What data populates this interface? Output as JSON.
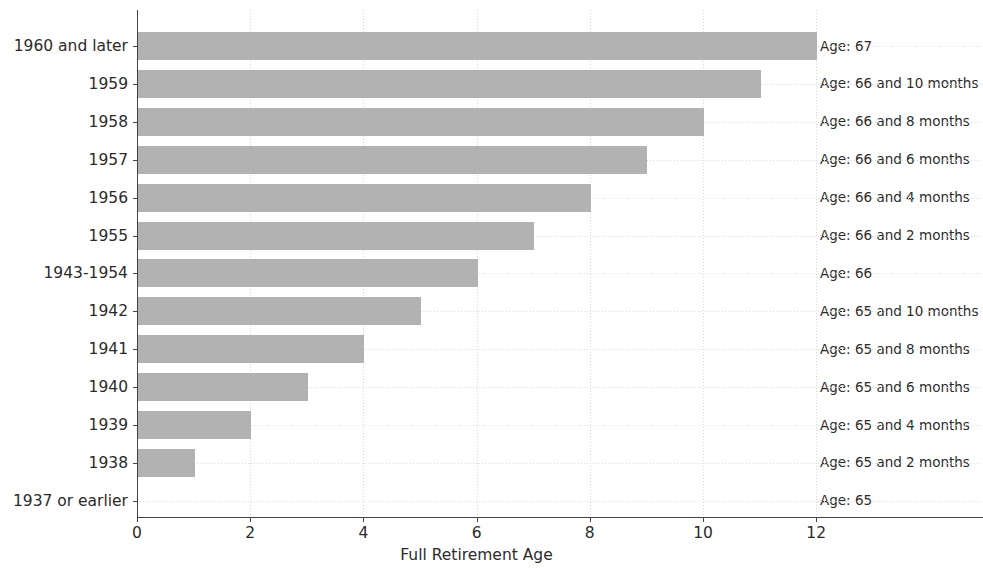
{
  "chart_data": {
    "type": "bar",
    "orientation": "horizontal",
    "title": "",
    "xlabel": "Full Retirement Age",
    "ylabel": "",
    "xlim": [
      0,
      12.7
    ],
    "xticks": [
      0,
      2,
      4,
      6,
      8,
      10,
      12
    ],
    "xtick_labels": [
      "0",
      "2",
      "4",
      "6",
      "8",
      "10",
      "12"
    ],
    "grid": true,
    "legend": null,
    "bar_color": "#b2b2b2",
    "categories": [
      "1960 and later",
      "1959",
      "1958",
      "1957",
      "1956",
      "1955",
      "1943-1954",
      "1942",
      "1941",
      "1940",
      "1939",
      "1938",
      "1937 or earlier"
    ],
    "values": [
      12,
      11,
      10,
      9,
      8,
      7,
      6,
      5,
      4,
      3,
      2,
      1,
      0
    ],
    "annotations": [
      "Age: 67",
      "Age: 66 and 10 months",
      "Age: 66 and 8 months",
      "Age: 66 and 6 months",
      "Age: 66 and 4 months",
      "Age: 66 and 2 months",
      "Age: 66",
      "Age: 65 and 10 months",
      "Age: 65 and 8 months",
      "Age: 65 and 6 months",
      "Age: 65 and 4 months",
      "Age: 65 and 2 months",
      "Age: 65"
    ]
  }
}
